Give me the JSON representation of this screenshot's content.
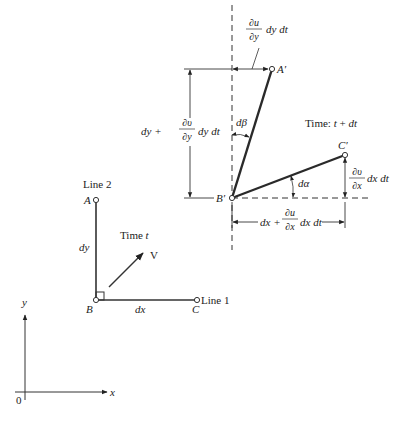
{
  "diagram": {
    "colors": {
      "line": "#2a2a2a",
      "thin": "#333333",
      "background": "#ffffff"
    },
    "axes": {
      "x_label": "x",
      "y_label": "y",
      "origin_label": "0"
    },
    "time_t": {
      "label": "Time t",
      "points": {
        "A": "A",
        "B": "B",
        "C": "C"
      },
      "line1_label": "Line 1",
      "line2_label": "Line 2",
      "dx_label": "dx",
      "dy_label": "dy",
      "velocity_label": "V"
    },
    "time_t_dt": {
      "label": "Time: t + dt",
      "points": {
        "A": "A′",
        "B": "B′",
        "C": "C′"
      },
      "d_beta": "dβ",
      "d_alpha": "dα",
      "du_dy_term": {
        "num": "∂u",
        "den": "∂y",
        "suffix": "dy dt"
      },
      "dv_dx_term": {
        "num": "∂υ",
        "den": "∂x",
        "suffix": "dx dt"
      },
      "vertical_dim": {
        "prefix": "dy +",
        "num": "∂υ",
        "den": "∂y",
        "suffix": "dy dt"
      },
      "horizontal_dim": {
        "prefix": "dx +",
        "num": "∂u",
        "den": "∂x",
        "suffix": "dx dt"
      }
    }
  }
}
